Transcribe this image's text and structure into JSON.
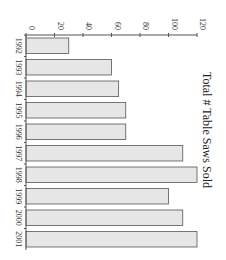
{
  "chart_data": {
    "type": "bar",
    "orientation": "rotated-90-clockwise",
    "title": "Total # Table Saws Sold",
    "xlabel": "",
    "ylabel": "",
    "categories": [
      "1992",
      "1993",
      "1994",
      "1995",
      "1996",
      "1997",
      "1998",
      "1999",
      "2000",
      "2001"
    ],
    "values": [
      30,
      60,
      65,
      70,
      70,
      110,
      120,
      100,
      110,
      120
    ],
    "ylim": [
      0,
      120
    ],
    "yticks": [
      0,
      20,
      40,
      60,
      80,
      100,
      120
    ],
    "grid": false,
    "legend": null,
    "bar_color": "#e6e6e6",
    "bar_edge_color": "#555555"
  }
}
